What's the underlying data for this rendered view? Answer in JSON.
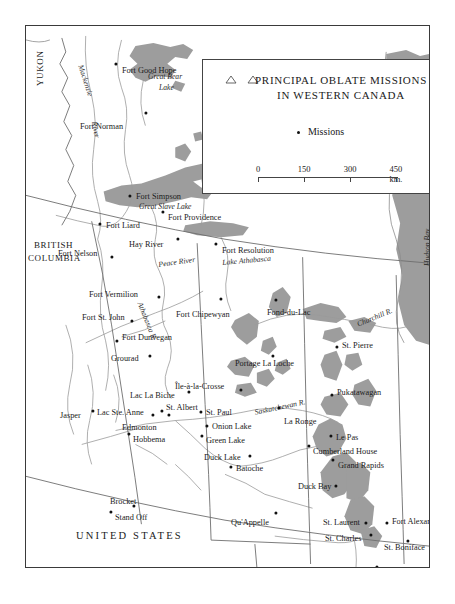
{
  "legend": {
    "title_line1": "PRINCIPAL OBLATE MISSIONS",
    "title_line2": "IN WESTERN CANADA",
    "symbol_label": "Missions",
    "symbol_icon": "mission-dot",
    "triangle_icon": "triangle-outline",
    "scale": {
      "ticks": [
        "0",
        "150",
        "300",
        "450 km."
      ],
      "values": [
        0,
        150,
        300,
        450
      ],
      "unit": "km."
    }
  },
  "regions": [
    {
      "name": "YUKON",
      "x": 10,
      "y": 60,
      "rotate": -90,
      "cls": "region"
    },
    {
      "name": "BRITISH",
      "x": 8,
      "y": 215,
      "rotate": 0,
      "cls": "region"
    },
    {
      "name": "COLUMBIA",
      "x": 2,
      "y": 228,
      "rotate": 0,
      "cls": "region"
    },
    {
      "name": "UNITED STATES",
      "x": 50,
      "y": 505,
      "rotate": 0,
      "cls": "country"
    }
  ],
  "water_labels": [
    {
      "name": "Mackenzie",
      "x": 58,
      "y": 38,
      "rotate": 72
    },
    {
      "name": "River",
      "x": 72,
      "y": 95,
      "rotate": 80
    },
    {
      "name": "Great Bear",
      "x": 122,
      "y": 47,
      "rotate": 0
    },
    {
      "name": "Lake",
      "x": 133,
      "y": 58,
      "rotate": 0
    },
    {
      "name": "Great Slave Lake",
      "x": 113,
      "y": 177,
      "rotate": 0
    },
    {
      "name": "Peace River",
      "x": 132,
      "y": 235,
      "rotate": -8
    },
    {
      "name": "Lake Athabasca",
      "x": 196,
      "y": 233,
      "rotate": -5
    },
    {
      "name": "Athabasca R.",
      "x": 117,
      "y": 275,
      "rotate": 68
    },
    {
      "name": "Churchill R.",
      "x": 330,
      "y": 295,
      "rotate": -22
    },
    {
      "name": "Saskatchewan R.",
      "x": 228,
      "y": 383,
      "rotate": -12
    },
    {
      "name": "Hudson Bay",
      "x": 398,
      "y": 240,
      "rotate": -90
    }
  ],
  "places": [
    {
      "name": "Fort Good Hope",
      "lx": 96,
      "ly": 41,
      "dx": 90,
      "dy": 38,
      "anchor": "left"
    },
    {
      "name": "Fort Norman",
      "lx": 54,
      "ly": 97,
      "dx": 120,
      "dy": 87,
      "anchor": "left"
    },
    {
      "name": "Fort Simpson",
      "lx": 110,
      "ly": 167,
      "dx": 104,
      "dy": 170,
      "anchor": "left"
    },
    {
      "name": "Fort Liard",
      "lx": 80,
      "ly": 196,
      "dx": 74,
      "dy": 198,
      "anchor": "left"
    },
    {
      "name": "Fort Providence",
      "lx": 142,
      "ly": 188,
      "dx": 137,
      "dy": 186,
      "anchor": "left"
    },
    {
      "name": "Hay River",
      "lx": 103,
      "ly": 215,
      "dx": 152,
      "dy": 213,
      "anchor": "left"
    },
    {
      "name": "Fort Resolution",
      "lx": 196,
      "ly": 221,
      "dx": 190,
      "dy": 218,
      "anchor": "left"
    },
    {
      "name": "Fort Nelson",
      "lx": 32,
      "ly": 224,
      "dx": 86,
      "dy": 231,
      "anchor": "left"
    },
    {
      "name": "Fort Vermilion",
      "lx": 63,
      "ly": 265,
      "dx": 133,
      "dy": 271,
      "anchor": "left"
    },
    {
      "name": "Fort St. John",
      "lx": 56,
      "ly": 288,
      "dx": 106,
      "dy": 295,
      "anchor": "left"
    },
    {
      "name": "Fort Chipewyan",
      "lx": 150,
      "ly": 285,
      "dx": 195,
      "dy": 273,
      "anchor": "left"
    },
    {
      "name": "Fond-du-Lac",
      "lx": 241,
      "ly": 283,
      "dx": 250,
      "dy": 274,
      "anchor": "left"
    },
    {
      "name": "Fort Dunvegan",
      "lx": 96,
      "ly": 308,
      "dx": 91,
      "dy": 315,
      "anchor": "left"
    },
    {
      "name": "Grourad",
      "lx": 85,
      "ly": 329,
      "dx": 124,
      "dy": 330,
      "anchor": "left",
      "display": "Grourad"
    },
    {
      "name": "Portage La Loche",
      "lx": 209,
      "ly": 334,
      "dx": 247,
      "dy": 330,
      "anchor": "left"
    },
    {
      "name": "St. Pierre",
      "lx": 316,
      "ly": 316,
      "dx": 311,
      "dy": 321,
      "anchor": "left"
    },
    {
      "name": "Pukatawagan",
      "lx": 311,
      "ly": 363,
      "dx": 306,
      "dy": 369,
      "anchor": "left"
    },
    {
      "name": "Ile-a-la-Crosse",
      "lx": 149,
      "ly": 357,
      "dx": 215,
      "dy": 364,
      "anchor": "left",
      "display": "Île-à-la-Crosse"
    },
    {
      "name": "Lac La Biche",
      "lx": 104,
      "ly": 366,
      "dx": 163,
      "dy": 366,
      "anchor": "left"
    },
    {
      "name": "St. Albert",
      "lx": 140,
      "ly": 378,
      "dx": 136,
      "dy": 385,
      "anchor": "left"
    },
    {
      "name": "Jasper",
      "lx": 34,
      "ly": 386,
      "dx": 67,
      "dy": 385,
      "anchor": "left"
    },
    {
      "name": "Lac Ste. Anne",
      "lx": 71,
      "ly": 383,
      "dx": 127,
      "dy": 389,
      "anchor": "left"
    },
    {
      "name": "St. Paul",
      "lx": 180,
      "ly": 383,
      "dx": 175,
      "dy": 386,
      "anchor": "left"
    },
    {
      "name": "La Ronge",
      "lx": 258,
      "ly": 392,
      "dx": 253,
      "dy": 382,
      "anchor": "left"
    },
    {
      "name": "Edmonton",
      "lx": 96,
      "ly": 398,
      "dx": 143,
      "dy": 389,
      "anchor": "left"
    },
    {
      "name": "Onion Lake",
      "lx": 186,
      "ly": 397,
      "dx": 181,
      "dy": 400,
      "anchor": "left"
    },
    {
      "name": "Hobbema",
      "lx": 107,
      "ly": 410,
      "dx": 103,
      "dy": 408,
      "anchor": "left"
    },
    {
      "name": "Green Lake",
      "lx": 180,
      "ly": 411,
      "dx": 176,
      "dy": 410,
      "anchor": "left"
    },
    {
      "name": "Le Pas",
      "lx": 310,
      "ly": 408,
      "dx": 305,
      "dy": 410,
      "anchor": "left"
    },
    {
      "name": "Cumberland House",
      "lx": 287,
      "ly": 422,
      "dx": 283,
      "dy": 420,
      "anchor": "left"
    },
    {
      "name": "Duck Lake",
      "lx": 178,
      "ly": 428,
      "dx": 224,
      "dy": 430,
      "anchor": "left"
    },
    {
      "name": "Batoche",
      "lx": 210,
      "ly": 439,
      "dx": 205,
      "dy": 441,
      "anchor": "left"
    },
    {
      "name": "Grand Rapids",
      "lx": 312,
      "ly": 436,
      "dx": 307,
      "dy": 434,
      "anchor": "left"
    },
    {
      "name": "Duck Bay",
      "lx": 272,
      "ly": 457,
      "dx": 310,
      "dy": 460,
      "anchor": "left"
    },
    {
      "name": "Brocket",
      "lx": 84,
      "ly": 472,
      "dx": 108,
      "dy": 480,
      "anchor": "left"
    },
    {
      "name": "Stand Off",
      "lx": 89,
      "ly": 488,
      "dx": 85,
      "dy": 486,
      "anchor": "left"
    },
    {
      "name": "Qu'Appelle",
      "lx": 205,
      "ly": 493,
      "dx": 250,
      "dy": 487,
      "anchor": "left"
    },
    {
      "name": "St. Laurent",
      "lx": 297,
      "ly": 493,
      "dx": 340,
      "dy": 497,
      "anchor": "left"
    },
    {
      "name": "Fort Alexander",
      "lx": 366,
      "ly": 492,
      "dx": 361,
      "dy": 497,
      "anchor": "left"
    },
    {
      "name": "St. Charles",
      "lx": 299,
      "ly": 509,
      "dx": 345,
      "dy": 509,
      "anchor": "left"
    },
    {
      "name": "St. Boniface",
      "lx": 358,
      "ly": 518,
      "dx": 382,
      "dy": 515,
      "anchor": "left"
    },
    {
      "name": "Pembina",
      "lx": 307,
      "ly": 545,
      "dx": 351,
      "dy": 541,
      "anchor": "left"
    }
  ]
}
